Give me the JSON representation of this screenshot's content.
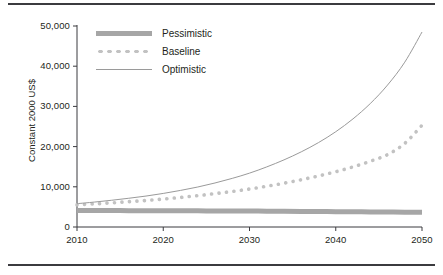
{
  "figure": {
    "has_top_rule": true,
    "has_bottom_rule": true,
    "rule_color": "#3b3b3f",
    "background": "#ffffff"
  },
  "chart_data": {
    "type": "line",
    "title": "",
    "subtitle": "",
    "xlabel": "",
    "ylabel": "Constant 2000 US$",
    "xlim": [
      2010,
      2050
    ],
    "ylim": [
      0,
      50000
    ],
    "grid": false,
    "legend_position": "upper-left",
    "xticks": [
      "2010",
      "2020",
      "2030",
      "2040",
      "2050"
    ],
    "xtick_values": [
      2010,
      2020,
      2030,
      2040,
      2050
    ],
    "yticks": [
      "0",
      "10,000",
      "20,000",
      "30,000",
      "40,000",
      "50,000"
    ],
    "ytick_values": [
      0,
      10000,
      20000,
      30000,
      40000,
      50000
    ],
    "x": [
      2010,
      2012,
      2014,
      2016,
      2018,
      2020,
      2022,
      2024,
      2026,
      2028,
      2030,
      2032,
      2034,
      2036,
      2038,
      2040,
      2042,
      2044,
      2046,
      2048,
      2050
    ],
    "series": [
      {
        "name": "Pessimistic",
        "style": "thick-solid",
        "color": "#a6a6a6",
        "values": [
          4100,
          4090,
          4080,
          4070,
          4060,
          4050,
          4040,
          4020,
          4000,
          3980,
          3960,
          3940,
          3910,
          3880,
          3850,
          3820,
          3790,
          3760,
          3730,
          3700,
          3650
        ]
      },
      {
        "name": "Baseline",
        "style": "dotted",
        "color": "#c2c2c2",
        "values": [
          5500,
          5750,
          6000,
          6300,
          6600,
          6950,
          7350,
          7800,
          8300,
          8850,
          9450,
          10150,
          10900,
          11750,
          12700,
          13750,
          14950,
          16350,
          18000,
          20800,
          25300
        ]
      },
      {
        "name": "Optimistic",
        "style": "thin-solid",
        "color": "#9a9a9a",
        "values": [
          5800,
          6200,
          6650,
          7150,
          7700,
          8350,
          9100,
          9950,
          10950,
          12100,
          13400,
          14950,
          16700,
          18700,
          21000,
          23700,
          26900,
          30700,
          35300,
          41000,
          48500
        ]
      }
    ]
  }
}
